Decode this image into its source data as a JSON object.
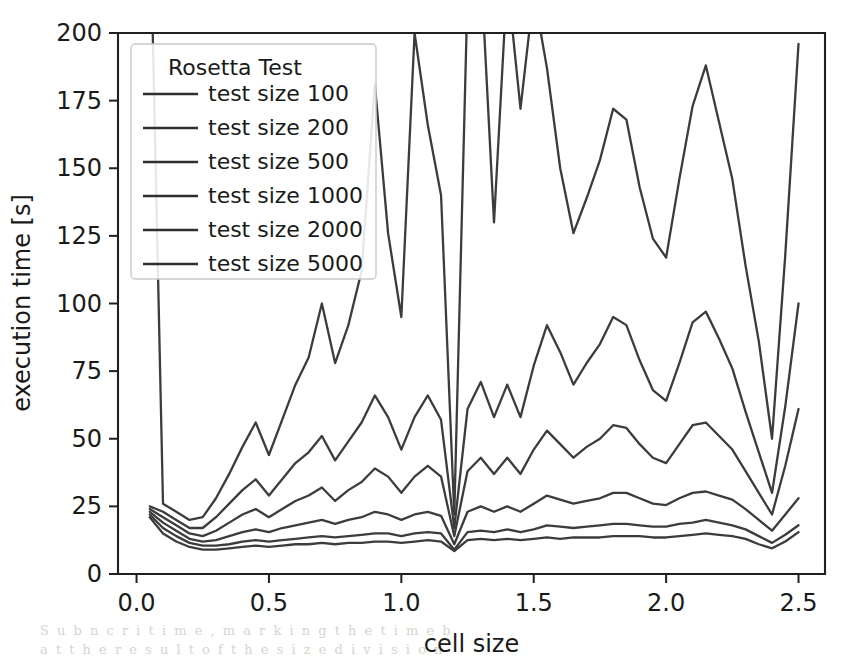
{
  "figure": {
    "name": "rosetta-test-execution-time-plot",
    "background_color": "#ffffff",
    "line_color": "#3c3c3c",
    "axis_color": "#231f20"
  },
  "chart_data": {
    "type": "line",
    "title": "",
    "xlabel": "cell size",
    "ylabel": "execution time [s]",
    "xlim": [
      -0.07,
      2.6
    ],
    "ylim": [
      0,
      200
    ],
    "xticks": [
      0.0,
      0.5,
      1.0,
      1.5,
      2.0,
      2.5
    ],
    "xtick_labels": [
      "0.0",
      "0.5",
      "1.0",
      "1.5",
      "2.0",
      "2.5"
    ],
    "yticks": [
      0,
      25,
      50,
      75,
      100,
      125,
      150,
      175,
      200
    ],
    "ytick_labels": [
      "0",
      "25",
      "50",
      "75",
      "100",
      "125",
      "150",
      "175",
      "200"
    ],
    "grid": false,
    "legend_title": "Rosetta Test",
    "legend_position": "upper left",
    "x": [
      0.05,
      0.1,
      0.15,
      0.2,
      0.25,
      0.3,
      0.35,
      0.4,
      0.45,
      0.5,
      0.55,
      0.6,
      0.65,
      0.7,
      0.75,
      0.8,
      0.85,
      0.9,
      0.95,
      1.0,
      1.05,
      1.1,
      1.15,
      1.2,
      1.25,
      1.3,
      1.35,
      1.4,
      1.45,
      1.5,
      1.55,
      1.6,
      1.65,
      1.7,
      1.75,
      1.8,
      1.85,
      1.9,
      1.95,
      2.0,
      2.05,
      2.1,
      2.15,
      2.2,
      2.25,
      2.3,
      2.35,
      2.4,
      2.45,
      2.5
    ],
    "series": [
      {
        "name": "test size 100",
        "label": "test size 100",
        "color": "#3c3c3c",
        "values": [
          21,
          15,
          12,
          10,
          9,
          9,
          9.5,
          10,
          10.5,
          10,
          10.5,
          11,
          11,
          11.5,
          11,
          11.5,
          11.5,
          12,
          12,
          11.5,
          12,
          12.5,
          12,
          8.5,
          12.5,
          13,
          12.5,
          13,
          12.5,
          13,
          13.5,
          13,
          13.5,
          13.5,
          13.5,
          14,
          14,
          14,
          13.5,
          13.5,
          14,
          14.5,
          15,
          14.5,
          14,
          13,
          11,
          9.5,
          12,
          15.5
        ]
      },
      {
        "name": "test size 200",
        "label": "test size 200",
        "color": "#3c3c3c",
        "values": [
          22,
          17,
          14,
          11.5,
          10.5,
          10.5,
          11,
          12,
          12.5,
          12,
          12.5,
          13,
          13.5,
          14,
          13.5,
          14,
          14.5,
          15,
          15,
          14,
          15,
          15.5,
          15,
          9,
          15.5,
          16,
          15.5,
          16.5,
          15.5,
          16.5,
          18,
          17.5,
          17,
          17.5,
          18,
          18.5,
          18.5,
          18,
          17.5,
          17.5,
          18.5,
          19,
          20,
          19,
          18,
          16.5,
          14,
          11.5,
          14.5,
          18
        ]
      },
      {
        "name": "test size 500",
        "label": "test size 500",
        "color": "#3c3c3c",
        "values": [
          23,
          19,
          16,
          13,
          12,
          12.5,
          14,
          15.5,
          16.5,
          15.5,
          17,
          18,
          19,
          20,
          18.5,
          20,
          21,
          23,
          22,
          20,
          22,
          23,
          21.5,
          11,
          23,
          25,
          23,
          25,
          23,
          26,
          29,
          27.5,
          26,
          27,
          28,
          30,
          30,
          28,
          26,
          25.5,
          28,
          30,
          30.5,
          29,
          27.5,
          24,
          20,
          16,
          22,
          28
        ]
      },
      {
        "name": "test size 1000",
        "label": "test size 1000",
        "color": "#3c3c3c",
        "values": [
          24,
          21,
          18,
          15,
          14,
          16,
          19,
          22,
          24,
          21,
          24,
          27,
          29,
          32,
          27,
          31,
          34,
          39,
          36,
          30,
          36,
          40,
          36,
          14,
          38,
          43,
          37,
          43,
          37,
          46,
          53,
          48,
          43,
          47,
          50,
          55,
          54,
          48,
          43,
          41,
          48,
          55,
          56,
          51,
          46,
          38,
          30,
          22,
          40,
          61
        ]
      },
      {
        "name": "test size 2000",
        "label": "test size 2000",
        "color": "#3c3c3c",
        "values": [
          25,
          23,
          20,
          17,
          17,
          21,
          26,
          31,
          35,
          29,
          35,
          41,
          45,
          51,
          42,
          49,
          56,
          66,
          58,
          46,
          58,
          66,
          57,
          17,
          61,
          71,
          58,
          70,
          58,
          77,
          92,
          82,
          70,
          78,
          85,
          95,
          92,
          79,
          68,
          64,
          78,
          93,
          97,
          87,
          76,
          60,
          45,
          30,
          62,
          100
        ]
      },
      {
        "name": "test size 5000",
        "label": "test size 5000",
        "color": "#3c3c3c",
        "values": [
          250,
          26,
          23,
          20,
          21,
          28,
          37,
          47,
          56,
          44,
          57,
          70,
          80,
          100,
          78,
          92,
          112,
          181,
          126,
          95,
          200,
          166,
          140,
          22,
          215,
          225,
          130,
          220,
          172,
          215,
          187,
          150,
          126,
          139,
          153,
          172,
          168,
          143,
          124,
          117,
          146,
          173,
          188,
          167,
          146,
          114,
          86,
          50,
          118,
          196
        ]
      }
    ]
  },
  "legend": {
    "title": "Rosetta Test",
    "entries": [
      "test size 100",
      "test size 200",
      "test size 500",
      "test size 1000",
      "test size 2000",
      "test size 5000"
    ]
  }
}
